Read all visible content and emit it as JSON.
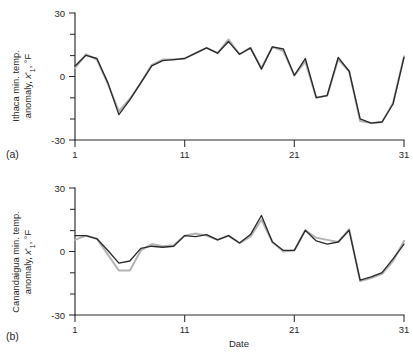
{
  "figure": {
    "panel_a_label": "(a)",
    "panel_b_label": "(b)"
  },
  "chart_data": [
    {
      "type": "line",
      "panel": "(a)",
      "title": "",
      "xlabel": "",
      "ylabel": "Ithaca min. temp. anomaly, x'₁, °F",
      "ylabel_parts": {
        "line1": "Ithaca min. temp.",
        "line2_pre": "anomaly, ",
        "line2_var": "x",
        "line2_prime": "'",
        "line2_sub": "1",
        "line2_post": ", °F"
      },
      "x": [
        1,
        2,
        3,
        4,
        5,
        6,
        7,
        8,
        9,
        10,
        11,
        12,
        13,
        14,
        15,
        16,
        17,
        18,
        19,
        20,
        21,
        22,
        23,
        24,
        25,
        26,
        27,
        28,
        29,
        30,
        31
      ],
      "xlim": [
        1,
        31
      ],
      "ylim": [
        -30,
        30
      ],
      "xticks": [
        1,
        11,
        21,
        31
      ],
      "xticklabels": [
        "1",
        "11",
        "21",
        "31"
      ],
      "yticks": [
        -30,
        -20,
        -10,
        0,
        10,
        20,
        30
      ],
      "yticklabels_shown": [
        "-30",
        "0",
        "30"
      ],
      "grid": false,
      "legend": "none",
      "series": [
        {
          "name": "observed",
          "color": "#2a2a2a",
          "values": [
            5,
            10,
            8.5,
            -3,
            -18,
            -11,
            -3,
            5,
            7.5,
            8,
            8.5,
            11,
            13.5,
            11,
            16.5,
            10.5,
            13.5,
            3.5,
            14,
            13,
            0.5,
            8.5,
            -10,
            -9,
            9,
            2.5,
            -20,
            -22,
            -21.5,
            -13,
            9
          ]
        },
        {
          "name": "simulated",
          "color": "#b4b4b4",
          "values": [
            4,
            10.5,
            8,
            -3.5,
            -16.5,
            -10.5,
            -3,
            5.5,
            8,
            8,
            8.5,
            11,
            13.5,
            11,
            17.5,
            10.5,
            13.5,
            4,
            14,
            12,
            0.5,
            7,
            -10,
            -9,
            8,
            2.5,
            -21,
            -22,
            -21.5,
            -12.5,
            9.5
          ]
        }
      ]
    },
    {
      "type": "line",
      "panel": "(b)",
      "title": "",
      "xlabel": "Date",
      "ylabel": "Canandaigua min. temp. anomaly, x'₁, °F",
      "ylabel_parts": {
        "line1": "Canandaigua min. temp.",
        "line2_pre": "anomaly, ",
        "line2_var": "x",
        "line2_prime": "'",
        "line2_sub": "1",
        "line2_post": ", °F"
      },
      "x": [
        1,
        2,
        3,
        4,
        5,
        6,
        7,
        8,
        9,
        10,
        11,
        12,
        13,
        14,
        15,
        16,
        17,
        18,
        19,
        20,
        21,
        22,
        23,
        24,
        25,
        26,
        27,
        28,
        29,
        30,
        31
      ],
      "xlim": [
        1,
        31
      ],
      "ylim": [
        -30,
        30
      ],
      "xticks": [
        1,
        11,
        21,
        31
      ],
      "xticklabels": [
        "1",
        "11",
        "21",
        "31"
      ],
      "yticks": [
        -30,
        -20,
        -10,
        0,
        10,
        20,
        30
      ],
      "yticklabels_shown": [
        "-30",
        "0",
        "30"
      ],
      "grid": false,
      "legend": "none",
      "series": [
        {
          "name": "observed",
          "color": "#2a2a2a",
          "values": [
            7.5,
            7.5,
            6,
            0.5,
            -5.5,
            -4.5,
            1.5,
            2.5,
            2,
            2.5,
            7.5,
            7,
            8,
            5.5,
            7.5,
            4,
            8,
            17,
            4.5,
            0.5,
            0.5,
            10,
            5,
            3.5,
            4.5,
            10,
            -13.5,
            -12,
            -10,
            -3.5,
            3.5
          ]
        },
        {
          "name": "simulated",
          "color": "#b4b4b4",
          "values": [
            5.5,
            7.5,
            6,
            -1.5,
            -9,
            -9,
            0.5,
            3.5,
            2.5,
            3,
            7.5,
            8.5,
            7.5,
            5.5,
            7.5,
            4,
            7,
            15,
            4.5,
            0,
            0.5,
            10,
            6.5,
            5.5,
            4.5,
            10.5,
            -14,
            -12.5,
            -10.5,
            -4.5,
            5
          ]
        }
      ]
    }
  ]
}
